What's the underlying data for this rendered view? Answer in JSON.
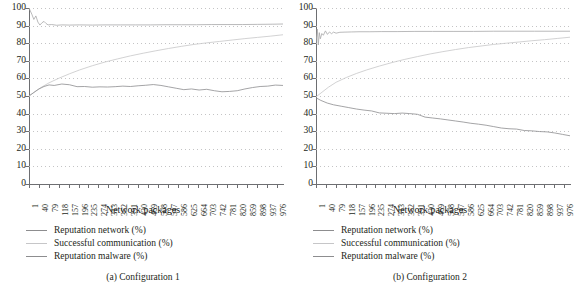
{
  "figure": {
    "width": 573,
    "height": 294,
    "background": "#ffffff",
    "text_color": "#231f20"
  },
  "panels": [
    {
      "key": "left",
      "caption": "(a)  Configuration 1",
      "xlabel": "Network packages",
      "legend": [
        {
          "label": "Reputation network (%)",
          "color": "#8d8d8f"
        },
        {
          "label": "Successful communication (%)",
          "color": "#c6c6c8"
        },
        {
          "label": "Reputation malware (%)",
          "color": "#8d8d8f"
        }
      ]
    },
    {
      "key": "right",
      "caption": "(b)  Configuration 2",
      "xlabel": "Network packages",
      "legend": [
        {
          "label": "Reputation network (%)",
          "color": "#8d8d8f"
        },
        {
          "label": "Successful communication (%)",
          "color": "#c6c6c8"
        },
        {
          "label": "Reputation malware (%)",
          "color": "#8d8d8f"
        }
      ]
    }
  ],
  "chart_data": [
    {
      "type": "line",
      "panel": "(a) Configuration 1",
      "title": "",
      "xlabel": "Network packages",
      "ylabel": "",
      "ylim": [
        0,
        100
      ],
      "yticks": [
        0,
        10,
        20,
        30,
        40,
        50,
        60,
        70,
        80,
        90,
        100
      ],
      "xlim": [
        1,
        1000
      ],
      "xticks": [
        1,
        40,
        79,
        118,
        157,
        196,
        235,
        274,
        313,
        352,
        391,
        430,
        469,
        508,
        547,
        586,
        625,
        664,
        703,
        742,
        781,
        820,
        859,
        898,
        937,
        976
      ],
      "grid": "horizontal-dotted",
      "legend_position": "below-left",
      "series": [
        {
          "name": "Reputation network (%)",
          "color": "#a8a8aa",
          "x": [
            1,
            12,
            20,
            28,
            36,
            44,
            52,
            60,
            68,
            76,
            90,
            110,
            130,
            160,
            200,
            250,
            300,
            360,
            420,
            480,
            540,
            600,
            660,
            720,
            780,
            840,
            900,
            960,
            1000
          ],
          "y": [
            100,
            96.5,
            93.5,
            95.5,
            92.0,
            90.3,
            91.6,
            92.4,
            91.2,
            90.4,
            90.6,
            90.2,
            90.4,
            90.3,
            90.4,
            90.3,
            90.4,
            90.4,
            90.4,
            90.4,
            90.5,
            90.5,
            90.5,
            90.6,
            90.6,
            90.6,
            90.7,
            90.8,
            90.9
          ]
        },
        {
          "name": "Successful communication (%)",
          "color": "#c6c6c8",
          "x": [
            1,
            25,
            50,
            80,
            120,
            160,
            200,
            250,
            300,
            350,
            400,
            450,
            500,
            550,
            600,
            650,
            700,
            750,
            800,
            850,
            900,
            950,
            1000
          ],
          "y": [
            50.0,
            52.5,
            55.0,
            57.5,
            60.2,
            62.6,
            64.8,
            67.2,
            69.3,
            71.1,
            72.8,
            74.3,
            75.7,
            77.0,
            78.2,
            79.3,
            80.2,
            81.0,
            81.8,
            82.6,
            83.3,
            84.0,
            84.8
          ]
        },
        {
          "name": "Reputation malware (%)",
          "color": "#8d8d8f",
          "x": [
            1,
            20,
            40,
            60,
            80,
            100,
            130,
            160,
            190,
            220,
            250,
            280,
            310,
            340,
            370,
            400,
            430,
            460,
            490,
            520,
            550,
            580,
            610,
            640,
            670,
            700,
            730,
            760,
            790,
            820,
            850,
            880,
            910,
            940,
            970,
            1000
          ],
          "y": [
            50.0,
            52.0,
            54.0,
            55.4,
            56.3,
            56.0,
            56.8,
            56.4,
            55.3,
            55.4,
            55.0,
            55.2,
            55.1,
            55.3,
            55.6,
            55.4,
            55.8,
            56.1,
            56.5,
            56.0,
            55.2,
            54.4,
            53.6,
            54.0,
            53.4,
            53.8,
            53.0,
            52.4,
            52.6,
            53.0,
            54.0,
            54.8,
            55.4,
            55.6,
            56.2,
            56.0
          ]
        }
      ]
    },
    {
      "type": "line",
      "panel": "(b) Configuration 2",
      "title": "",
      "xlabel": "Network packages",
      "ylabel": "",
      "ylim": [
        0,
        100
      ],
      "yticks": [
        0,
        10,
        20,
        30,
        40,
        50,
        60,
        70,
        80,
        90,
        100
      ],
      "xlim": [
        1,
        1000
      ],
      "xticks": [
        1,
        40,
        79,
        118,
        157,
        196,
        235,
        274,
        313,
        352,
        391,
        430,
        469,
        508,
        547,
        586,
        625,
        664,
        703,
        742,
        781,
        820,
        859,
        898,
        937,
        976
      ],
      "grid": "horizontal-dotted",
      "legend_position": "below-left",
      "series": [
        {
          "name": "Reputation network (%)",
          "color": "#a8a8aa",
          "x": [
            1,
            6,
            10,
            14,
            18,
            24,
            30,
            38,
            46,
            54,
            62,
            70,
            80,
            95,
            115,
            140,
            170,
            210,
            260,
            320,
            390,
            460,
            540,
            620,
            700,
            780,
            860,
            940,
            1000
          ],
          "y": [
            80.0,
            88.0,
            79.0,
            86.0,
            82.5,
            85.5,
            84.5,
            87.0,
            85.0,
            86.4,
            85.4,
            86.3,
            85.7,
            86.2,
            86.3,
            86.4,
            86.5,
            86.5,
            86.6,
            86.6,
            86.7,
            86.7,
            86.7,
            86.7,
            86.8,
            86.8,
            86.8,
            86.8,
            86.8
          ]
        },
        {
          "name": "Successful communication (%)",
          "color": "#c6c6c8",
          "x": [
            1,
            25,
            50,
            80,
            120,
            160,
            200,
            250,
            300,
            350,
            400,
            450,
            500,
            550,
            600,
            650,
            700,
            750,
            800,
            850,
            900,
            950,
            1000
          ],
          "y": [
            49.5,
            52.2,
            55.0,
            57.8,
            60.5,
            62.8,
            64.8,
            67.0,
            69.0,
            70.8,
            72.4,
            73.9,
            75.2,
            76.4,
            77.5,
            78.4,
            79.3,
            80.0,
            80.7,
            81.4,
            82.0,
            82.7,
            83.4
          ]
        },
        {
          "name": "Reputation malware (%)",
          "color": "#8d8d8f",
          "x": [
            1,
            20,
            45,
            70,
            100,
            130,
            160,
            190,
            220,
            250,
            280,
            310,
            340,
            370,
            400,
            430,
            460,
            490,
            520,
            550,
            580,
            610,
            640,
            670,
            700,
            730,
            760,
            790,
            820,
            850,
            880,
            910,
            940,
            970,
            1000
          ],
          "y": [
            49.0,
            47.5,
            46.0,
            45.0,
            44.2,
            43.4,
            42.6,
            42.0,
            41.5,
            40.4,
            40.2,
            40.0,
            40.3,
            40.0,
            39.6,
            38.0,
            37.5,
            37.0,
            36.4,
            35.8,
            35.2,
            34.5,
            34.0,
            33.4,
            32.6,
            31.8,
            31.4,
            31.2,
            30.4,
            30.2,
            29.8,
            29.6,
            29.0,
            28.2,
            27.4
          ]
        }
      ]
    }
  ]
}
